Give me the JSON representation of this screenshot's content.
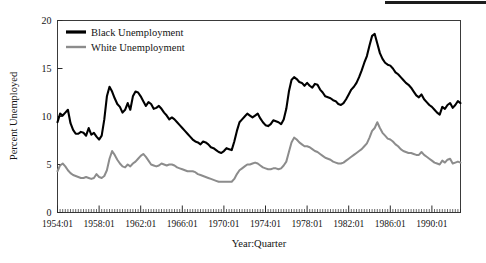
{
  "chart_data": {
    "type": "line",
    "title": "",
    "xlabel": "Year:Quarter",
    "ylabel": "Percent Unemployed",
    "ylim": [
      0,
      20
    ],
    "yticks": [
      0,
      5,
      10,
      15,
      20
    ],
    "ytick_labels": [
      "0",
      "5",
      "10",
      "15",
      "20"
    ],
    "xlim": [
      "1954:01",
      "1990:04"
    ],
    "xtick_labels": [
      "1954:01",
      "1958:01",
      "1962:01",
      "1966:01",
      "1970:01",
      "1974:01",
      "1978:01",
      "1982:01",
      "1986:01",
      "1990:01"
    ],
    "grid": false,
    "legend_position": "top-left",
    "minor_ticks": "quarterly",
    "x_start_year": 1954,
    "x_quarters_per_year": 4,
    "series": [
      {
        "name": "Black Unemployment",
        "color": "#000000",
        "line_width": 2.1,
        "values": [
          9.4,
          10.3,
          10.1,
          10.4,
          10.7,
          9.3,
          8.6,
          8.2,
          8.2,
          8.4,
          8.3,
          8.0,
          8.8,
          8.1,
          8.3,
          7.9,
          7.6,
          8.0,
          9.7,
          12.1,
          13.1,
          12.6,
          11.9,
          11.3,
          11.0,
          10.4,
          10.7,
          11.4,
          10.7,
          12.1,
          12.6,
          12.5,
          12.1,
          11.6,
          11.1,
          11.5,
          11.3,
          10.8,
          10.9,
          11.1,
          10.8,
          10.4,
          10.1,
          9.7,
          9.9,
          9.7,
          9.4,
          9.1,
          8.8,
          8.5,
          8.2,
          7.9,
          7.6,
          7.4,
          7.3,
          7.1,
          7.4,
          7.3,
          7.1,
          6.8,
          6.7,
          6.5,
          6.3,
          6.2,
          6.4,
          6.7,
          6.6,
          6.5,
          7.4,
          8.5,
          9.4,
          9.7,
          10.0,
          10.3,
          10.1,
          9.9,
          10.1,
          10.3,
          9.8,
          9.4,
          9.1,
          9.0,
          9.2,
          9.6,
          9.5,
          9.4,
          9.2,
          9.7,
          10.8,
          12.6,
          13.8,
          14.1,
          13.9,
          13.6,
          13.5,
          13.2,
          13.5,
          13.2,
          13.0,
          13.4,
          13.3,
          12.8,
          12.5,
          12.1,
          12.0,
          11.9,
          11.7,
          11.6,
          11.3,
          11.2,
          11.4,
          11.8,
          12.3,
          12.8,
          13.1,
          13.5,
          14.1,
          14.8,
          15.6,
          16.3,
          17.4,
          18.4,
          18.6,
          17.6,
          16.6,
          16.0,
          15.6,
          15.4,
          15.3,
          15.0,
          14.6,
          14.4,
          14.1,
          13.8,
          13.5,
          13.3,
          13.0,
          12.6,
          12.2,
          12.0,
          12.3,
          11.8,
          11.5,
          11.2,
          11.0,
          10.7,
          10.4,
          10.2,
          11.0,
          10.8,
          11.2,
          11.4,
          10.9,
          11.2,
          11.6,
          11.4
        ]
      },
      {
        "name": "White Unemployment",
        "color": "#8c8c8c",
        "line_width": 2.0,
        "values": [
          4.3,
          4.9,
          5.1,
          4.8,
          4.4,
          4.1,
          3.9,
          3.8,
          3.7,
          3.6,
          3.6,
          3.7,
          3.6,
          3.5,
          3.6,
          4.0,
          3.7,
          3.6,
          3.8,
          4.4,
          5.6,
          6.4,
          6.0,
          5.5,
          5.1,
          4.8,
          4.7,
          5.0,
          4.8,
          5.1,
          5.3,
          5.6,
          5.9,
          6.1,
          5.8,
          5.4,
          5.0,
          4.9,
          4.8,
          4.9,
          5.1,
          5.0,
          4.9,
          5.0,
          5.0,
          4.9,
          4.7,
          4.6,
          4.5,
          4.4,
          4.3,
          4.3,
          4.3,
          4.2,
          4.0,
          3.9,
          3.8,
          3.7,
          3.6,
          3.5,
          3.4,
          3.3,
          3.2,
          3.2,
          3.2,
          3.2,
          3.2,
          3.2,
          3.5,
          4.0,
          4.4,
          4.6,
          4.8,
          5.0,
          5.0,
          5.1,
          5.2,
          5.1,
          4.9,
          4.7,
          4.6,
          4.5,
          4.5,
          4.6,
          4.6,
          4.5,
          4.6,
          4.9,
          5.3,
          6.3,
          7.3,
          7.8,
          7.6,
          7.3,
          7.1,
          6.9,
          6.9,
          6.8,
          6.6,
          6.4,
          6.3,
          6.1,
          5.9,
          5.7,
          5.6,
          5.5,
          5.3,
          5.2,
          5.1,
          5.1,
          5.2,
          5.4,
          5.6,
          5.8,
          6.0,
          6.2,
          6.4,
          6.6,
          6.9,
          7.2,
          7.8,
          8.5,
          8.8,
          9.4,
          8.8,
          8.3,
          8.0,
          7.7,
          7.6,
          7.4,
          7.1,
          6.9,
          6.6,
          6.4,
          6.3,
          6.2,
          6.2,
          6.1,
          6.0,
          6.0,
          6.3,
          6.0,
          5.8,
          5.6,
          5.4,
          5.2,
          5.1,
          5.0,
          5.4,
          5.2,
          5.5,
          5.6,
          5.1,
          5.2,
          5.3,
          5.2
        ]
      }
    ]
  },
  "legend": {
    "items": [
      {
        "label": "Black Unemployment",
        "color": "#000000"
      },
      {
        "label": "White Unemployment",
        "color": "#8c8c8c"
      }
    ]
  }
}
